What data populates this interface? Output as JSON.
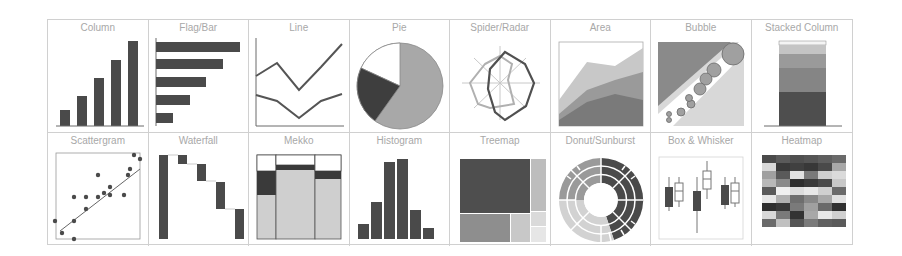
{
  "gallery": {
    "colors": {
      "dark": "#4a4a4a",
      "mid": "#7a7a7a",
      "light": "#a8a8a8",
      "pale": "#cfcfcf",
      "border": "#d0d0d0",
      "label": "#a8a8a8"
    },
    "tiles": [
      {
        "id": "column",
        "label": "Column"
      },
      {
        "id": "flag-bar",
        "label": "Flag/Bar"
      },
      {
        "id": "line",
        "label": "Line"
      },
      {
        "id": "pie",
        "label": "Pie"
      },
      {
        "id": "spider-radar",
        "label": "Spider/Radar"
      },
      {
        "id": "area",
        "label": "Area"
      },
      {
        "id": "bubble",
        "label": "Bubble"
      },
      {
        "id": "stacked-column",
        "label": "Stacked Column"
      },
      {
        "id": "scattergram",
        "label": "Scattergram"
      },
      {
        "id": "waterfall",
        "label": "Waterfall"
      },
      {
        "id": "mekko",
        "label": "Mekko"
      },
      {
        "id": "histogram",
        "label": "Histogram"
      },
      {
        "id": "treemap",
        "label": "Treemap"
      },
      {
        "id": "donut-sunburst",
        "label": "Donut/Sunburst"
      },
      {
        "id": "box-whisker",
        "label": "Box & Whisker"
      },
      {
        "id": "heatmap",
        "label": "Heatmap"
      }
    ]
  }
}
